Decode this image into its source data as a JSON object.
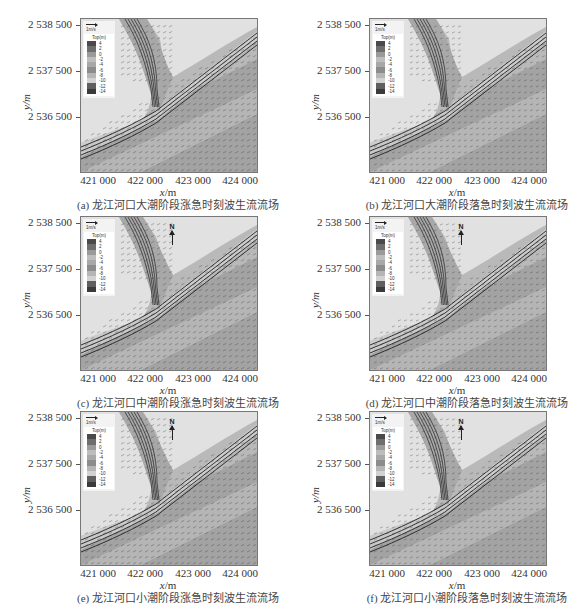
{
  "figure": {
    "panels": [
      {
        "id": "a",
        "caption": "(a) 龙江河口大潮阶段涨急时刻波生流流场",
        "tide": "大潮",
        "phase": "涨急",
        "show_north": false,
        "left": 0,
        "top": 0
      },
      {
        "id": "b",
        "caption": "(b) 龙江河口大潮阶段落急时刻波生流流场",
        "tide": "大潮",
        "phase": "落急",
        "show_north": false,
        "left": 289,
        "top": 0
      },
      {
        "id": "c",
        "caption": "(c) 龙江河口中潮阶段涨急时刻波生流流场",
        "tide": "中潮",
        "phase": "涨急",
        "show_north": true,
        "left": 0,
        "top": 198
      },
      {
        "id": "d",
        "caption": "(d) 龙江河口中潮阶段落急时刻波生流流场",
        "tide": "中潮",
        "phase": "落急",
        "show_north": true,
        "left": 289,
        "top": 198
      },
      {
        "id": "e",
        "caption": "(e) 龙江河口小潮阶段涨急时刻波生流流场",
        "tide": "小潮",
        "phase": "涨急",
        "show_north": true,
        "left": 0,
        "top": 393
      },
      {
        "id": "f",
        "caption": "(f) 龙江河口小潮阶段落急时刻波生流流场",
        "tide": "小潮",
        "phase": "落急",
        "show_north": true,
        "left": 289,
        "top": 393
      }
    ],
    "axes": {
      "xlabel_var": "x",
      "xlabel_unit": "/m",
      "ylabel": "y/m",
      "xticks": [
        "421 000",
        "422 000",
        "423 000",
        "424 000"
      ],
      "yticks": [
        "2 538 500",
        "2 537 500",
        "2 536 500"
      ]
    },
    "legend": {
      "scale_label": "1m/s",
      "title": "Top(m)",
      "levels": [
        "4",
        "2",
        "0",
        "-2",
        "-4",
        "-6",
        "-8",
        "-10",
        "-12",
        "-14"
      ],
      "colors": [
        "#4a4a4a",
        "#6e6e6e",
        "#9a9a9a",
        "#bdbdbd",
        "#a8a8a8",
        "#8c8c8c",
        "#b5b5b5",
        "#d2d2d2",
        "#5f5f5f",
        "#3a3a3a"
      ]
    },
    "north_label": "N"
  },
  "chart_data": [
    {
      "type": "heatmap",
      "title": "(a) 龙江河口大潮阶段涨急时刻波生流流场",
      "xlabel": "x/m",
      "ylabel": "y/m",
      "xticks": [
        421000,
        422000,
        423000,
        424000
      ],
      "yticks": [
        2538500,
        2537500,
        2536500
      ],
      "colorbar": {
        "title": "Top(m)",
        "levels": [
          4,
          2,
          0,
          -2,
          -4,
          -6,
          -8,
          -10,
          -12,
          -14
        ]
      },
      "vector_scale": "1m/s",
      "overlay": "wave-induced current vectors"
    },
    {
      "type": "heatmap",
      "title": "(b) 龙江河口大潮阶段落急时刻波生流流场",
      "xlabel": "x/m",
      "ylabel": "y/m",
      "xticks": [
        421000,
        422000,
        423000,
        424000
      ],
      "yticks": [
        2538500,
        2537500,
        2536500
      ],
      "colorbar": {
        "title": "Top(m)",
        "levels": [
          4,
          2,
          0,
          -2,
          -4,
          -6,
          -8,
          -10,
          -12,
          -14
        ]
      },
      "vector_scale": "1m/s",
      "overlay": "wave-induced current vectors"
    },
    {
      "type": "heatmap",
      "title": "(c) 龙江河口中潮阶段涨急时刻波生流流场",
      "xlabel": "x/m",
      "ylabel": "y/m",
      "xticks": [
        421000,
        422000,
        423000,
        424000
      ],
      "yticks": [
        2538500,
        2537500,
        2536500
      ],
      "colorbar": {
        "title": "Top(m)",
        "levels": [
          4,
          2,
          0,
          -2,
          -4,
          -6,
          -8,
          -10,
          -12,
          -14
        ]
      },
      "vector_scale": "1m/s",
      "north_arrow": true
    },
    {
      "type": "heatmap",
      "title": "(d) 龙江河口中潮阶段落急时刻波生流流场",
      "xlabel": "x/m",
      "ylabel": "y/m",
      "xticks": [
        421000,
        422000,
        423000,
        424000
      ],
      "yticks": [
        2538500,
        2537500,
        2536500
      ],
      "colorbar": {
        "title": "Top(m)",
        "levels": [
          4,
          2,
          0,
          -2,
          -4,
          -6,
          -8,
          -10,
          -12,
          -14
        ]
      },
      "vector_scale": "1m/s",
      "north_arrow": true
    },
    {
      "type": "heatmap",
      "title": "(e) 龙江河口小潮阶段涨急时刻波生流流场",
      "xlabel": "x/m",
      "ylabel": "y/m",
      "xticks": [
        421000,
        422000,
        423000,
        424000
      ],
      "yticks": [
        2538500,
        2537500,
        2536500
      ],
      "colorbar": {
        "title": "Top(m)",
        "levels": [
          4,
          2,
          0,
          -2,
          -4,
          -6,
          -8,
          -10,
          -12,
          -14
        ]
      },
      "vector_scale": "1m/s",
      "north_arrow": true
    },
    {
      "type": "heatmap",
      "title": "(f) 龙江河口小潮阶段落急时刻波生流流场",
      "xlabel": "x/m",
      "ylabel": "y/m",
      "xticks": [
        421000,
        422000,
        423000,
        424000
      ],
      "yticks": [
        2538500,
        2537500,
        2536500
      ],
      "colorbar": {
        "title": "Top(m)",
        "levels": [
          4,
          2,
          0,
          -2,
          -4,
          -6,
          -8,
          -10,
          -12,
          -14
        ]
      },
      "vector_scale": "1m/s",
      "north_arrow": true
    }
  ]
}
